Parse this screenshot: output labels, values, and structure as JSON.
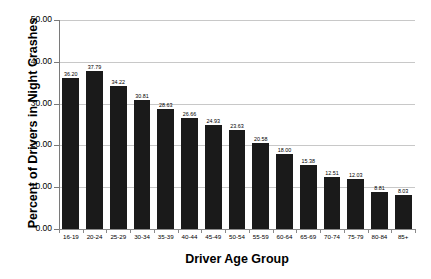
{
  "chart_data": {
    "type": "bar",
    "title": "",
    "xlabel": "Driver Age Group",
    "ylabel": "Percent of Drivers in Night Crashes",
    "categories": [
      "16-19",
      "20-24",
      "25-29",
      "30-34",
      "35-39",
      "40-44",
      "45-49",
      "50-54",
      "55-59",
      "60-64",
      "65-69",
      "70-74",
      "75-79",
      "80-84",
      "85+"
    ],
    "values": [
      36.2,
      37.79,
      34.22,
      30.81,
      28.63,
      26.66,
      24.93,
      23.63,
      20.58,
      18.0,
      15.38,
      12.51,
      12.03,
      8.81,
      8.03
    ],
    "value_labels": [
      "36.20",
      "37.79",
      "34.22",
      "30.81",
      "28.63",
      "26.66",
      "24.93",
      "23.63",
      "20.58",
      "18.00",
      "15.38",
      "12.51",
      "12.03",
      "8.81",
      "8.03"
    ],
    "ylim": [
      0,
      50
    ],
    "ytick_values": [
      0,
      10,
      20,
      30,
      40,
      50
    ],
    "ytick_labels": [
      "0.00",
      "10.00",
      "20.00",
      "30.00",
      "40.00",
      "50.00"
    ],
    "grid": true,
    "legend": false,
    "bar_color": "#1a1a1a",
    "gridline_color": "#c8c8c8",
    "background_color": "#ffffff"
  }
}
